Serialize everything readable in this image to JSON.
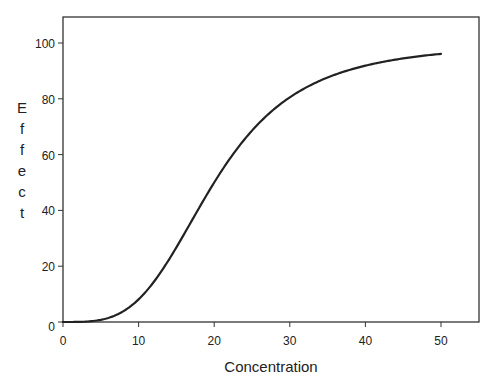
{
  "chart_data": {
    "type": "line",
    "title": "",
    "xlabel": "Concentration",
    "ylabel": "Effect",
    "xlim": [
      0,
      55
    ],
    "ylim": [
      0,
      110
    ],
    "x_ticks": [
      0,
      10,
      20,
      30,
      40,
      50
    ],
    "y_ticks": [
      0,
      20,
      40,
      60,
      80,
      100
    ],
    "grid": false,
    "legend": null,
    "series": [
      {
        "name": "Effect",
        "model": "Hill equation: E = 100 * C^3.5 / (20^3.5 + C^3.5)",
        "x": [
          0,
          2,
          4,
          6,
          8,
          10,
          12,
          14,
          16,
          18,
          20,
          22,
          24,
          26,
          28,
          30,
          32,
          34,
          36,
          38,
          40,
          42,
          44,
          46,
          48,
          50
        ],
        "y": [
          0,
          0.03,
          0.4,
          1.5,
          3.9,
          8.1,
          14.1,
          22.0,
          31.1,
          40.8,
          50.0,
          58.3,
          65.5,
          71.5,
          76.5,
          80.5,
          83.8,
          86.5,
          88.7,
          90.5,
          91.9,
          93.2,
          94.2,
          95.0,
          95.7,
          96.0
        ],
        "color": "#222222"
      }
    ]
  },
  "axes": {
    "x_title": "Concentration",
    "y_title": "Effect"
  }
}
